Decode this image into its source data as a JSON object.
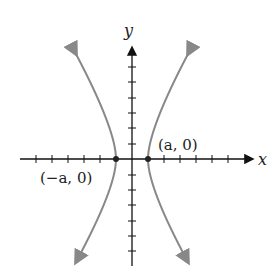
{
  "diagram": {
    "type": "hyperbola",
    "axes": {
      "x_label": "x",
      "y_label": "y"
    },
    "points": [
      {
        "label": "(a, 0)",
        "name": "right-vertex"
      },
      {
        "label": "(−a, 0)",
        "name": "left-vertex"
      }
    ],
    "colors": {
      "curve": "#888888",
      "axis": "#111111"
    }
  }
}
